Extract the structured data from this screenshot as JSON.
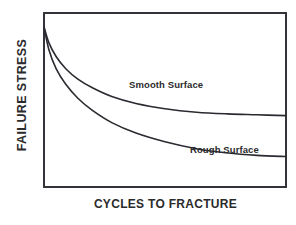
{
  "chart_data": {
    "type": "line",
    "title": "",
    "subtitle": "",
    "xlabel": "CYCLES TO FRACTURE",
    "ylabel": "FAILURE STRESS",
    "xlim": [
      0,
      100
    ],
    "ylim": [
      0,
      100
    ],
    "grid": false,
    "axis_ticks": false,
    "tick_labels": {
      "x": [],
      "y": []
    },
    "legend_position": "inline-annotation",
    "annotations": [
      {
        "name": "smooth-surface-label",
        "text": "Smooth Surface",
        "x": 48,
        "y": 63
      },
      {
        "name": "rough-surface-label",
        "text": "Rough Surface",
        "x": 73,
        "y": 25
      }
    ],
    "series": [
      {
        "name": "Smooth Surface",
        "color": "#2a2a30",
        "x": [
          0,
          2,
          5,
          9,
          14,
          20,
          28,
          38,
          50,
          63,
          76,
          88,
          100
        ],
        "values": [
          92,
          83,
          75,
          68,
          62,
          57,
          52,
          48,
          45,
          43,
          42,
          41.5,
          41
        ]
      },
      {
        "name": "Rough Surface",
        "color": "#2a2a30",
        "x": [
          0,
          2,
          5,
          9,
          14,
          20,
          28,
          38,
          50,
          63,
          76,
          88,
          100
        ],
        "values": [
          92,
          79,
          68,
          59,
          51,
          44,
          37,
          31,
          26,
          22,
          19.5,
          18.2,
          17.5
        ]
      }
    ]
  },
  "axes": {
    "y_title": "FAILURE STRESS",
    "x_title": "CYCLES TO FRACTURE"
  },
  "series_labels": {
    "smooth": "Smooth Surface",
    "rough": "Rough Surface"
  },
  "colors": {
    "background": "#ffffff",
    "frame": "#33333a",
    "curve": "#2a2a30",
    "text": "#2b2b2b"
  }
}
